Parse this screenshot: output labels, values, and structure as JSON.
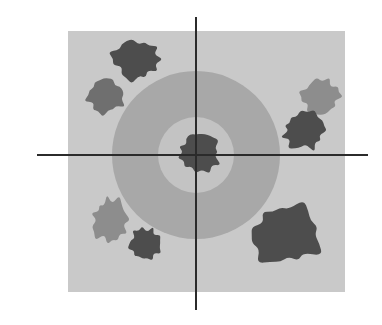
{
  "figure": {
    "canvas": {
      "width": 382,
      "height": 325,
      "background": "#ffffff"
    },
    "field": {
      "name": "gray-field-square",
      "x": 68,
      "y": 31,
      "width": 277,
      "height": 261,
      "fill": "#c9c9c9"
    },
    "zones": [
      {
        "name": "outer-annulus",
        "shape": "circle",
        "cx": 196,
        "cy": 155,
        "r": 84,
        "fill": "#a8a8a8",
        "label": "outer zone"
      },
      {
        "name": "inner-disc",
        "shape": "circle",
        "cx": 196,
        "cy": 155,
        "r": 38,
        "fill": "#c3c3c3",
        "label": "inner zone"
      }
    ],
    "axes": {
      "stroke": "#2b2b2b",
      "stroke_width": 2,
      "origin": {
        "x": 196,
        "y": 155
      },
      "horizontal": {
        "x1": 37,
        "y1": 155,
        "x2": 368,
        "y2": 155
      },
      "vertical": {
        "x1": 196,
        "y1": 17,
        "x2": 196,
        "y2": 310
      }
    },
    "palette": {
      "blob_dark": "#4d4d4d",
      "blob_medium": "#6f6f6f",
      "blob_light": "#8d8d8d",
      "field": "#c9c9c9",
      "annulus": "#a8a8a8",
      "inner": "#c3c3c3",
      "axis": "#2b2b2b"
    },
    "clusters": [
      {
        "name": "cluster-top-left-dark",
        "tone": "dark",
        "fill": "#4d4d4d",
        "cx": 136,
        "cy": 59,
        "rx": 25,
        "ry": 22,
        "seed": 11,
        "quadrant": "upper-left"
      },
      {
        "name": "cluster-upper-left-medium",
        "tone": "medium",
        "fill": "#6f6f6f",
        "cx": 106,
        "cy": 95,
        "rx": 20,
        "ry": 19,
        "seed": 23,
        "quadrant": "upper-left"
      },
      {
        "name": "cluster-upper-right-light",
        "tone": "light",
        "fill": "#8d8d8d",
        "cx": 320,
        "cy": 97,
        "rx": 21,
        "ry": 19,
        "seed": 37,
        "quadrant": "upper-right"
      },
      {
        "name": "cluster-right-dark",
        "tone": "dark",
        "fill": "#4d4d4d",
        "cx": 304,
        "cy": 131,
        "rx": 22,
        "ry": 20,
        "seed": 41,
        "quadrant": "upper-right"
      },
      {
        "name": "cluster-center-dark",
        "tone": "dark",
        "fill": "#4d4d4d",
        "cx": 199,
        "cy": 152,
        "rx": 23,
        "ry": 21,
        "seed": 53,
        "quadrant": "origin"
      },
      {
        "name": "cluster-lower-left-light",
        "tone": "light",
        "fill": "#8d8d8d",
        "cx": 110,
        "cy": 220,
        "rx": 19,
        "ry": 23,
        "seed": 67,
        "quadrant": "lower-left"
      },
      {
        "name": "cluster-lower-left-dark",
        "tone": "dark",
        "fill": "#4d4d4d",
        "cx": 145,
        "cy": 244,
        "rx": 18,
        "ry": 17,
        "seed": 79,
        "quadrant": "lower-left"
      },
      {
        "name": "cluster-lower-right-dark",
        "tone": "dark",
        "fill": "#4d4d4d",
        "cx": 285,
        "cy": 235,
        "rx": 37,
        "ry": 32,
        "seed": 97,
        "quadrant": "lower-right"
      }
    ]
  }
}
